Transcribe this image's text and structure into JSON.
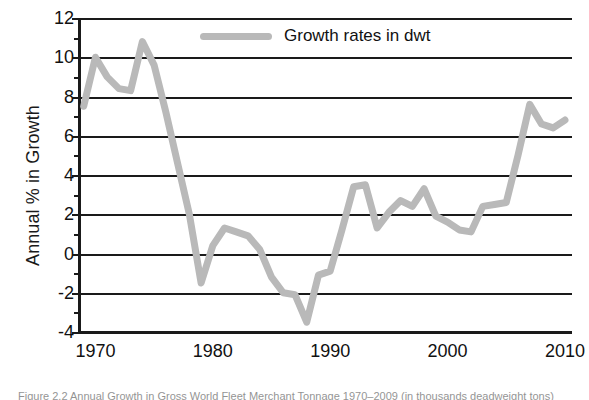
{
  "chart_data": {
    "type": "line",
    "title": "",
    "subtitle": "",
    "xlabel": "",
    "ylabel": "Annual % in Growth",
    "xlim": [
      1968.6,
      2010.6
    ],
    "ylim": [
      -4,
      12
    ],
    "grid": "horizontal",
    "legend_position": "top-center-inside",
    "y_ticks": [
      12,
      10,
      8,
      6,
      4,
      2,
      0,
      -2,
      -4
    ],
    "y_tick_labels": [
      "12",
      "10",
      "8",
      "6",
      "4",
      "2",
      "0",
      "-2",
      "-4"
    ],
    "y_minor_tick_step": 1,
    "x_ticks": [
      1970,
      1980,
      1990,
      2000,
      2010
    ],
    "x_tick_labels": [
      "1970",
      "1980",
      "1990",
      "2000",
      "2010"
    ],
    "series": [
      {
        "name": "Growth rates in dwt",
        "color": "#b9b9b9",
        "line_width": 7,
        "x": [
          1969,
          1970,
          1971,
          1972,
          1973,
          1974,
          1975,
          1976,
          1977,
          1978,
          1979,
          1980,
          1981,
          1982,
          1983,
          1984,
          1985,
          1986,
          1987,
          1988,
          1989,
          1990,
          1991,
          1992,
          1993,
          1994,
          1995,
          1996,
          1997,
          1998,
          1999,
          2000,
          2001,
          2002,
          2003,
          2004,
          2005,
          2006,
          2007,
          2008,
          2009,
          2010
        ],
        "values": [
          7.5,
          10.0,
          9.0,
          8.4,
          8.3,
          10.8,
          9.6,
          7.2,
          4.6,
          2.0,
          -1.5,
          0.4,
          1.3,
          1.1,
          0.9,
          0.2,
          -1.2,
          -2.0,
          -2.1,
          -3.5,
          -1.1,
          -0.9,
          1.2,
          3.4,
          3.5,
          1.3,
          2.1,
          2.7,
          2.4,
          3.3,
          1.9,
          1.6,
          1.2,
          1.1,
          2.4,
          2.5,
          2.6,
          5.0,
          7.6,
          6.6,
          6.4,
          6.8
        ]
      }
    ]
  },
  "legend": {
    "label": "Growth rates in dwt",
    "swatch_color": "#b9b9b9"
  },
  "axes": {
    "y_title": "Annual % in Growth",
    "y_tick_labels": [
      "12",
      "10",
      "8",
      "6",
      "4",
      "2",
      "0",
      "-2",
      "-4"
    ],
    "x_tick_labels": [
      "1970",
      "1980",
      "1990",
      "2000",
      "2010"
    ]
  },
  "caption": {
    "text": "Figure 2.2 Annual Growth in Gross World Fleet Merchant Tonnage 1970–2009 (in thousands deadweight tons)"
  },
  "colors": {
    "line": "#b9b9b9",
    "axis": "#1a1a1a",
    "grid": "#1a1a1a",
    "text": "#111111",
    "background": "#ffffff"
  }
}
